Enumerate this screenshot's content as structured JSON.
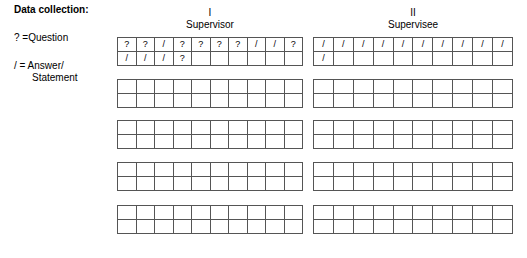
{
  "legend": {
    "title": "Data collection:",
    "question_key": "? =Question",
    "answer_key": "/ = Answer/",
    "answer_key_cont": "Statement"
  },
  "columns": [
    {
      "id": "supervisor",
      "numeral": "I",
      "caption": "Supervisor",
      "blocks": [
        {
          "filled": true,
          "rows": [
            [
              "?",
              "?",
              "/",
              "?",
              "?",
              "?",
              "?",
              "/",
              "/",
              "?"
            ],
            [
              "/",
              "/",
              "/",
              "?",
              "",
              "",
              "",
              "",
              "",
              ""
            ]
          ]
        },
        {
          "filled": false,
          "rows": [
            [
              "",
              "",
              "",
              "",
              "",
              "",
              "",
              "",
              "",
              ""
            ],
            [
              "",
              "",
              "",
              "",
              "",
              "",
              "",
              "",
              "",
              ""
            ]
          ]
        },
        {
          "filled": false,
          "rows": [
            [
              "",
              "",
              "",
              "",
              "",
              "",
              "",
              "",
              "",
              ""
            ],
            [
              "",
              "",
              "",
              "",
              "",
              "",
              "",
              "",
              "",
              ""
            ]
          ]
        },
        {
          "filled": false,
          "rows": [
            [
              "",
              "",
              "",
              "",
              "",
              "",
              "",
              "",
              "",
              ""
            ],
            [
              "",
              "",
              "",
              "",
              "",
              "",
              "",
              "",
              "",
              ""
            ]
          ]
        },
        {
          "filled": false,
          "rows": [
            [
              "",
              "",
              "",
              "",
              "",
              "",
              "",
              "",
              "",
              ""
            ],
            [
              "",
              "",
              "",
              "",
              "",
              "",
              "",
              "",
              "",
              ""
            ]
          ]
        }
      ]
    },
    {
      "id": "supervisee",
      "numeral": "II",
      "caption": "Supervisee",
      "blocks": [
        {
          "filled": true,
          "rows": [
            [
              "/",
              "/",
              "/",
              "/",
              "/",
              "/",
              "/",
              "/",
              "/",
              "/"
            ],
            [
              "/",
              "",
              "",
              "",
              "",
              "",
              "",
              "",
              "",
              ""
            ]
          ]
        },
        {
          "filled": false,
          "rows": [
            [
              "",
              "",
              "",
              "",
              "",
              "",
              "",
              "",
              "",
              ""
            ],
            [
              "",
              "",
              "",
              "",
              "",
              "",
              "",
              "",
              "",
              ""
            ]
          ]
        },
        {
          "filled": false,
          "rows": [
            [
              "",
              "",
              "",
              "",
              "",
              "",
              "",
              "",
              "",
              ""
            ],
            [
              "",
              "",
              "",
              "",
              "",
              "",
              "",
              "",
              "",
              ""
            ]
          ]
        },
        {
          "filled": false,
          "rows": [
            [
              "",
              "",
              "",
              "",
              "",
              "",
              "",
              "",
              "",
              ""
            ],
            [
              "",
              "",
              "",
              "",
              "",
              "",
              "",
              "",
              "",
              ""
            ]
          ]
        },
        {
          "filled": false,
          "rows": [
            [
              "",
              "",
              "",
              "",
              "",
              "",
              "",
              "",
              "",
              ""
            ],
            [
              "",
              "",
              "",
              "",
              "",
              "",
              "",
              "",
              "",
              ""
            ]
          ]
        }
      ]
    }
  ],
  "grid": {
    "columns_per_block": 10,
    "rows_per_block": 2,
    "blocks_per_column": 5
  },
  "colors": {
    "border": "#555555",
    "text": "#000000",
    "background": "#ffffff"
  }
}
